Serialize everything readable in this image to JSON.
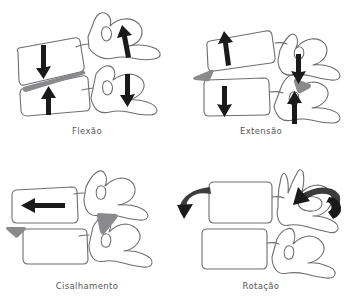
{
  "figure": {
    "background_color": "#ffffff",
    "line_color": "#6e6e70",
    "arrow_color": "#1a1a1a",
    "wedge_color": "#8a8a8c",
    "caption_color": "#58585a",
    "layout": "2x2 grid of lateral cervical vertebra line drawings"
  },
  "panels": [
    {
      "id": "flexao",
      "label": "Flexão",
      "position": "top-left",
      "arrows": [
        {
          "name": "superior-body-down-arrow",
          "direction": "down",
          "location": "upper vertebral body"
        },
        {
          "name": "inferior-body-up-arrow",
          "direction": "up",
          "location": "lower vertebral body"
        },
        {
          "name": "superior-facet-up-arrow",
          "direction": "up",
          "location": "upper posterior element"
        },
        {
          "name": "inferior-facet-down-arrow",
          "direction": "down",
          "location": "lower posterior element"
        }
      ],
      "wedges": [
        {
          "name": "anterior-disc-wedge",
          "shape": "posteriorly-open wedge",
          "location": "anterior intervertebral disc space"
        }
      ]
    },
    {
      "id": "extensao",
      "label": "Extensão",
      "position": "top-right",
      "arrows": [
        {
          "name": "superior-body-up-arrow",
          "direction": "up",
          "location": "upper vertebral body"
        },
        {
          "name": "inferior-body-down-arrow",
          "direction": "down",
          "location": "lower vertebral body"
        },
        {
          "name": "superior-facet-down-arrow",
          "direction": "down",
          "location": "upper posterior element"
        },
        {
          "name": "inferior-facet-up-arrow",
          "direction": "up",
          "location": "lower posterior element"
        }
      ],
      "wedges": [
        {
          "name": "anterior-disc-wedge",
          "shape": "triangle",
          "location": "anterior disc space"
        },
        {
          "name": "posterior-facet-wedge",
          "shape": "triangle",
          "location": "facet joint"
        }
      ]
    },
    {
      "id": "cisalhamento",
      "label": "Cisalhamento",
      "position": "bottom-left",
      "arrows": [
        {
          "name": "superior-body-left-arrow",
          "direction": "left",
          "location": "upper vertebral body"
        }
      ],
      "wedges": [
        {
          "name": "anterior-disc-wedge",
          "shape": "triangle",
          "location": "anterior-inferior disc space"
        },
        {
          "name": "posterior-facet-wedge",
          "shape": "triangle",
          "location": "facet joint"
        }
      ]
    },
    {
      "id": "rotacao",
      "label": "Rotação",
      "position": "bottom-right",
      "arrows": [
        {
          "name": "left-rotation-curved-arrow",
          "direction": "curved counter-clockwise",
          "location": "anterior left of upper vertebra"
        },
        {
          "name": "right-rotation-curved-arrow",
          "direction": "curved clockwise",
          "location": "posterior right of upper vertebra"
        }
      ],
      "wedges": []
    }
  ]
}
